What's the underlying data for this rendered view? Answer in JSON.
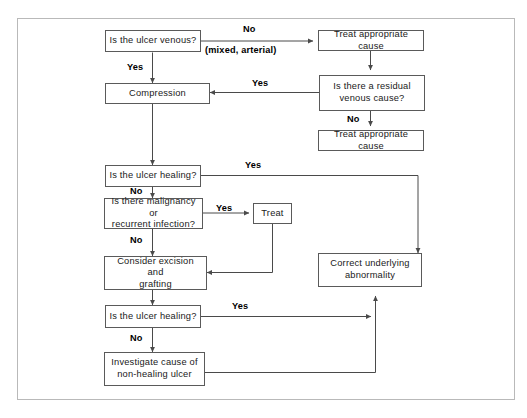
{
  "diagram": {
    "frame": {
      "stroke": "#b9b9b9"
    },
    "node_stroke": "#5a5a5a",
    "wire_stroke": "#4a4a4a",
    "background": "#ffffff",
    "nodes": [
      {
        "id": "ulcer-venous",
        "label": "Is the ulcer venous?"
      },
      {
        "id": "treat-cause-top",
        "label": "Treat appropriate cause"
      },
      {
        "id": "compression",
        "label": "Compression"
      },
      {
        "id": "residual-venous",
        "label": "Is there a residual\nvenous cause?"
      },
      {
        "id": "treat-cause-second",
        "label": "Treat appropriate cause"
      },
      {
        "id": "ulcer-healing-1",
        "label": "Is the ulcer healing?"
      },
      {
        "id": "malignancy",
        "label": "Is there malignancy or\nrecurrent infection?"
      },
      {
        "id": "treat",
        "label": "Treat"
      },
      {
        "id": "excision-grafting",
        "label": "Consider excision and\ngrafting"
      },
      {
        "id": "correct-underlying",
        "label": "Correct underlying\nabnormality"
      },
      {
        "id": "ulcer-healing-2",
        "label": "Is the ulcer healing?"
      },
      {
        "id": "investigate-cause",
        "label": "Investigate cause of\nnon-healing ulcer"
      }
    ],
    "edge_labels": [
      {
        "id": "no-top",
        "text": "No"
      },
      {
        "id": "mixed-arterial",
        "text": "(mixed, arterial)"
      },
      {
        "id": "yes-venous",
        "text": "Yes"
      },
      {
        "id": "yes-residual",
        "text": "Yes"
      },
      {
        "id": "no-residual",
        "text": "No"
      },
      {
        "id": "yes-healing-1",
        "text": "Yes"
      },
      {
        "id": "no-healing-1",
        "text": "No"
      },
      {
        "id": "yes-malignancy",
        "text": "Yes"
      },
      {
        "id": "no-malignancy",
        "text": "No"
      },
      {
        "id": "yes-healing-2",
        "text": "Yes"
      },
      {
        "id": "no-healing-2",
        "text": "No"
      }
    ]
  }
}
